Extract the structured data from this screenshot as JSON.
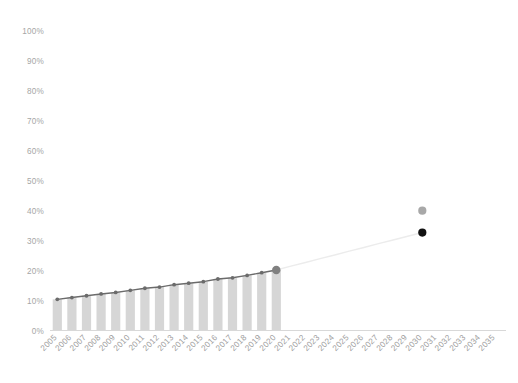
{
  "chart_data": {
    "type": "bar",
    "title": "",
    "subtitle": "",
    "xlabel": "",
    "ylabel": "",
    "ylim": [
      0,
      100
    ],
    "yticks": [
      0,
      10,
      20,
      30,
      40,
      50,
      60,
      70,
      80,
      90,
      100
    ],
    "ytick_labels": [
      "0%",
      "10%",
      "20%",
      "30%",
      "40%",
      "50%",
      "60%",
      "70%",
      "80%",
      "90%",
      "100%"
    ],
    "grid": false,
    "legend": "none",
    "categories": [
      "2005",
      "2006",
      "2007",
      "2008",
      "2009",
      "2010",
      "2011",
      "2012",
      "2013",
      "2014",
      "2015",
      "2016",
      "2017",
      "2018",
      "2019",
      "2020",
      "2021",
      "2022",
      "2023",
      "2024",
      "2025",
      "2026",
      "2027",
      "2028",
      "2029",
      "2030",
      "2031",
      "2032",
      "2033",
      "2034",
      "2035"
    ],
    "series": [
      {
        "name": "Historical share (bars)",
        "type": "bar",
        "color": "#d6d6d6",
        "values": [
          10.4,
          11.0,
          11.6,
          12.2,
          12.7,
          13.4,
          14.1,
          14.5,
          15.3,
          15.8,
          16.3,
          17.2,
          17.6,
          18.4,
          19.3,
          20.2,
          null,
          null,
          null,
          null,
          null,
          null,
          null,
          null,
          null,
          null,
          null,
          null,
          null,
          null,
          null
        ]
      },
      {
        "name": "Historical trend (line)",
        "type": "line",
        "color": "#6b6b6b",
        "values": [
          10.4,
          11.0,
          11.6,
          12.2,
          12.7,
          13.4,
          14.1,
          14.5,
          15.3,
          15.8,
          16.3,
          17.2,
          17.6,
          18.4,
          19.3,
          20.2,
          null,
          null,
          null,
          null,
          null,
          null,
          null,
          null,
          null,
          null,
          null,
          null,
          null,
          null,
          null
        ]
      },
      {
        "name": "Projection to target (line)",
        "type": "line",
        "color": "#ececec",
        "values": [
          null,
          null,
          null,
          null,
          null,
          null,
          null,
          null,
          null,
          null,
          null,
          null,
          null,
          null,
          null,
          20.2,
          21.5,
          22.7,
          24.0,
          25.2,
          26.5,
          27.7,
          29.0,
          30.2,
          31.5,
          32.7,
          null,
          null,
          null,
          null,
          null
        ]
      }
    ],
    "points": [
      {
        "name": "upper-target-2030",
        "x": "2030",
        "y": 40.0,
        "color": "#a8a8a8"
      },
      {
        "name": "lower-target-2030",
        "x": "2030",
        "y": 32.7,
        "color": "#111111"
      },
      {
        "name": "last-actual-2020",
        "x": "2020",
        "y": 20.2,
        "color": "#808080"
      }
    ]
  }
}
